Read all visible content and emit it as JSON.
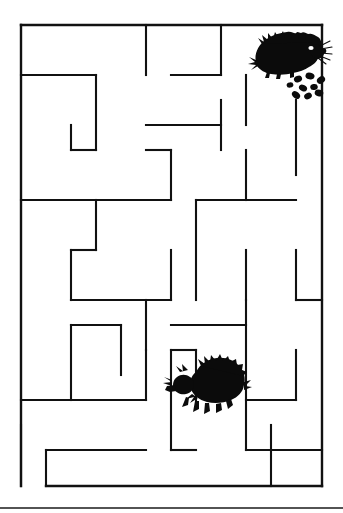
{
  "document": {
    "type": "maze-puzzle",
    "title": "Hedgehog Maze",
    "background_color": "#ffffff",
    "ink_color": "#0b0b0b",
    "width": 343,
    "height": 513
  },
  "maze": {
    "origin_x": 21,
    "origin_y": 25,
    "cell": 25,
    "cols": 12,
    "rows": 18,
    "wall_color": "#111111",
    "wall_thickness": 2.1,
    "entrance": {
      "label": "bottom-left opening",
      "x": 21,
      "y": 486
    },
    "border_segments": [
      {
        "name": "top-border",
        "x1": 21,
        "y1": 25,
        "x2": 322,
        "y2": 25
      },
      {
        "name": "left-border",
        "x1": 21,
        "y1": 25,
        "x2": 21,
        "y2": 486
      },
      {
        "name": "right-border",
        "x1": 322,
        "y1": 25,
        "x2": 322,
        "y2": 486
      },
      {
        "name": "bottom-border",
        "x1": 46,
        "y1": 486,
        "x2": 322,
        "y2": 486
      }
    ],
    "interior_segments": [
      {
        "x1": 21,
        "y1": 75,
        "x2": 96,
        "y2": 75
      },
      {
        "x1": 96,
        "y1": 75,
        "x2": 96,
        "y2": 150
      },
      {
        "x1": 71,
        "y1": 125,
        "x2": 71,
        "y2": 150
      },
      {
        "x1": 71,
        "y1": 150,
        "x2": 96,
        "y2": 150
      },
      {
        "x1": 146,
        "y1": 25,
        "x2": 146,
        "y2": 75
      },
      {
        "x1": 171,
        "y1": 75,
        "x2": 221,
        "y2": 75
      },
      {
        "x1": 221,
        "y1": 25,
        "x2": 221,
        "y2": 75
      },
      {
        "x1": 246,
        "y1": 75,
        "x2": 246,
        "y2": 125
      },
      {
        "x1": 146,
        "y1": 125,
        "x2": 221,
        "y2": 125
      },
      {
        "x1": 221,
        "y1": 100,
        "x2": 221,
        "y2": 150
      },
      {
        "x1": 146,
        "y1": 150,
        "x2": 171,
        "y2": 150
      },
      {
        "x1": 171,
        "y1": 150,
        "x2": 171,
        "y2": 200
      },
      {
        "x1": 296,
        "y1": 100,
        "x2": 296,
        "y2": 175
      },
      {
        "x1": 246,
        "y1": 150,
        "x2": 246,
        "y2": 200
      },
      {
        "x1": 21,
        "y1": 200,
        "x2": 171,
        "y2": 200
      },
      {
        "x1": 96,
        "y1": 200,
        "x2": 96,
        "y2": 250
      },
      {
        "x1": 71,
        "y1": 250,
        "x2": 71,
        "y2": 300
      },
      {
        "x1": 71,
        "y1": 250,
        "x2": 96,
        "y2": 250
      },
      {
        "x1": 71,
        "y1": 300,
        "x2": 171,
        "y2": 300
      },
      {
        "x1": 171,
        "y1": 250,
        "x2": 171,
        "y2": 300
      },
      {
        "x1": 196,
        "y1": 200,
        "x2": 296,
        "y2": 200
      },
      {
        "x1": 196,
        "y1": 200,
        "x2": 196,
        "y2": 300
      },
      {
        "x1": 246,
        "y1": 250,
        "x2": 246,
        "y2": 300
      },
      {
        "x1": 296,
        "y1": 250,
        "x2": 296,
        "y2": 300
      },
      {
        "x1": 296,
        "y1": 300,
        "x2": 322,
        "y2": 300
      },
      {
        "x1": 146,
        "y1": 300,
        "x2": 146,
        "y2": 350
      },
      {
        "x1": 21,
        "y1": 425,
        "x2": 21,
        "y2": 486
      },
      {
        "x1": 71,
        "y1": 325,
        "x2": 121,
        "y2": 325
      },
      {
        "x1": 71,
        "y1": 325,
        "x2": 71,
        "y2": 400
      },
      {
        "x1": 121,
        "y1": 325,
        "x2": 121,
        "y2": 375
      },
      {
        "x1": 146,
        "y1": 350,
        "x2": 146,
        "y2": 400
      },
      {
        "x1": 21,
        "y1": 400,
        "x2": 146,
        "y2": 400
      },
      {
        "x1": 171,
        "y1": 325,
        "x2": 246,
        "y2": 325
      },
      {
        "x1": 246,
        "y1": 300,
        "x2": 246,
        "y2": 450
      },
      {
        "x1": 171,
        "y1": 350,
        "x2": 196,
        "y2": 350
      },
      {
        "x1": 171,
        "y1": 350,
        "x2": 171,
        "y2": 450
      },
      {
        "x1": 196,
        "y1": 350,
        "x2": 196,
        "y2": 400
      },
      {
        "x1": 171,
        "y1": 450,
        "x2": 196,
        "y2": 450
      },
      {
        "x1": 246,
        "y1": 400,
        "x2": 296,
        "y2": 400
      },
      {
        "x1": 296,
        "y1": 350,
        "x2": 296,
        "y2": 400
      },
      {
        "x1": 271,
        "y1": 425,
        "x2": 271,
        "y2": 486
      },
      {
        "x1": 246,
        "y1": 450,
        "x2": 322,
        "y2": 450
      },
      {
        "x1": 46,
        "y1": 450,
        "x2": 146,
        "y2": 450
      },
      {
        "x1": 46,
        "y1": 450,
        "x2": 46,
        "y2": 486
      }
    ]
  },
  "figures": [
    {
      "name": "hedgehog-goal",
      "description": "hedgehog eating food pellets",
      "x": 250,
      "y": 28,
      "width": 72,
      "height": 72,
      "facing": "right",
      "has_food": true,
      "food_pellet_count": 9
    },
    {
      "name": "hedgehog-start",
      "description": "hedgehog walking",
      "x": 168,
      "y": 357,
      "width": 82,
      "height": 72,
      "facing": "left",
      "has_food": false,
      "food_pellet_count": 0
    }
  ],
  "page_edge": {
    "name": "page-bottom-edge",
    "y": 508,
    "color": "#1a1a1a"
  }
}
